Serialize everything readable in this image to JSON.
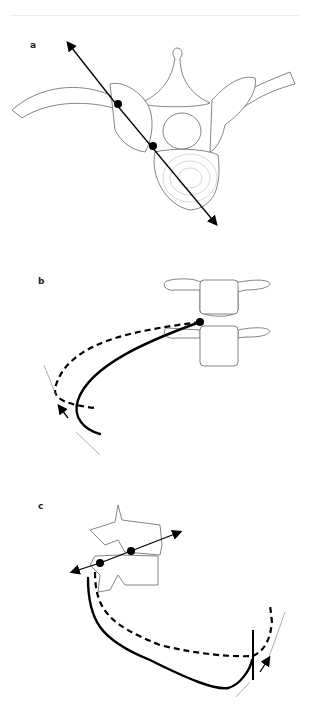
{
  "figure": {
    "panels": [
      {
        "label": "a",
        "view": "axial vertebra with rib, trajectory axis through two points"
      },
      {
        "label": "b",
        "view": "two vertebral bodies with solid and dashed rib curves"
      },
      {
        "label": "c",
        "view": "lateral vertebrae with axis and solid/dashed rib curves"
      }
    ]
  }
}
